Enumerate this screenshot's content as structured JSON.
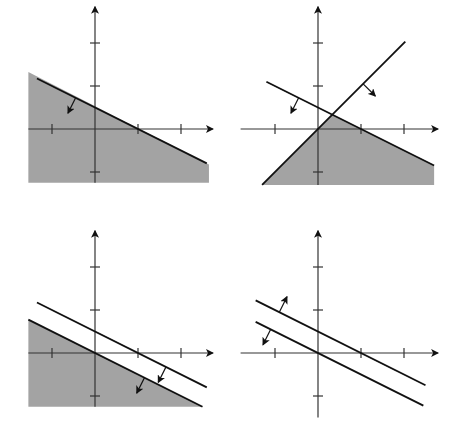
{
  "figure": {
    "panels": [
      {
        "id": "a",
        "caption": "(a)",
        "x_label": "x",
        "y_label": "y",
        "x_ticks": [
          -1,
          1,
          2
        ],
        "y_ticks": [
          -1,
          1,
          2
        ],
        "lines": [
          {
            "equation": "x + 2y = 1",
            "x_range": [
              -1.35,
              2.6
            ],
            "arrow_at": -0.45,
            "arrow_dir": "down"
          }
        ],
        "shaded_region": "x + 2y <= 1",
        "shade_color": "#a3a3a3"
      },
      {
        "id": "b",
        "caption": "(b)",
        "x_label": "x",
        "y_label": "y",
        "x_ticks": [
          -1,
          1,
          2
        ],
        "y_ticks": [
          -1,
          1,
          2
        ],
        "lines": [
          {
            "equation": "x + 2y = 1",
            "x_range": [
              -1.2,
              2.7
            ],
            "arrow_at": -0.45,
            "arrow_dir": "down"
          },
          {
            "equation": "y = x",
            "x_range": [
              -1.3,
              2.03
            ],
            "arrow_at": 1.05,
            "arrow_dir": "down"
          }
        ],
        "shaded_region": "x + 2y <= 1 and y <= x",
        "shade_color": "#a3a3a3"
      },
      {
        "id": "c",
        "caption": "(c)",
        "x_label": "x",
        "y_label": "y",
        "x_ticks": [
          -1,
          1,
          2
        ],
        "y_ticks": [
          -1,
          1,
          2
        ],
        "lines": [
          {
            "equation": "x + 2y = 1",
            "x_range": [
              -1.35,
              2.6
            ],
            "arrow_at": 1.65,
            "arrow_dir": "down"
          },
          {
            "equation": "x + 2y = 0",
            "x_range": [
              -1.55,
              2.5
            ],
            "arrow_at": 1.15,
            "arrow_dir": "down"
          }
        ],
        "shaded_region": "x + 2y <= 0",
        "shade_color": "#a3a3a3"
      },
      {
        "id": "d",
        "caption": "(d)",
        "x_label": "x",
        "y_label": "y",
        "x_ticks": [
          -1,
          1,
          2
        ],
        "y_ticks": [
          -1,
          1,
          2
        ],
        "lines": [
          {
            "equation": "x + 2y = 1",
            "x_range": [
              -1.45,
              2.5
            ],
            "arrow_at": -0.9,
            "arrow_dir": "up"
          },
          {
            "equation": "x + 2y = 0",
            "x_range": [
              -1.45,
              2.45
            ],
            "arrow_at": -1.1,
            "arrow_dir": "down"
          }
        ],
        "shaded_region": "none",
        "shade_color": "#a3a3a3"
      }
    ]
  }
}
